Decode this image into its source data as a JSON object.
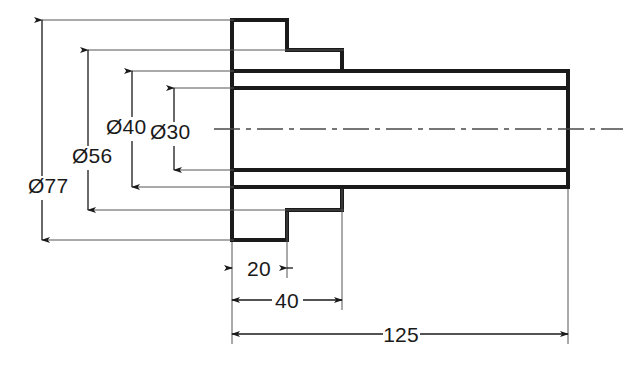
{
  "drawing": {
    "type": "engineering-drawing",
    "view": "sectional-side-view",
    "description": "Stepped cylindrical bushing / flanged sleeve, sectional side view",
    "background_color": "#ffffff",
    "line_color": "#1a1a1a",
    "thin_line_color": "#4a4a4a",
    "dimensions": {
      "diameters": [
        {
          "name": "outer-flange-diameter",
          "label": "Ø77",
          "value": 77,
          "symbol": "Ø",
          "orientation": "vertical",
          "text_x": 28,
          "text_y": 193
        },
        {
          "name": "second-step-diameter",
          "label": "Ø56",
          "value": 56,
          "symbol": "Ø",
          "orientation": "vertical",
          "text_x": 72,
          "text_y": 163
        },
        {
          "name": "body-outer-diameter",
          "label": "Ø40",
          "value": 40,
          "symbol": "Ø",
          "orientation": "vertical",
          "text_x": 106,
          "text_y": 134
        },
        {
          "name": "bore-diameter",
          "label": "Ø30",
          "value": 30,
          "symbol": "Ø",
          "orientation": "vertical",
          "text_x": 150,
          "text_y": 139
        }
      ],
      "lengths": [
        {
          "name": "flange-thickness",
          "label": "20",
          "value": 20,
          "orientation": "horizontal",
          "text_x": 259,
          "text_y": 276
        },
        {
          "name": "shoulder-length",
          "label": "40",
          "value": 40,
          "orientation": "horizontal",
          "text_x": 287,
          "text_y": 308
        },
        {
          "name": "overall-length",
          "label": "125",
          "value": 125,
          "orientation": "horizontal",
          "text_x": 400,
          "text_y": 342
        }
      ]
    }
  }
}
